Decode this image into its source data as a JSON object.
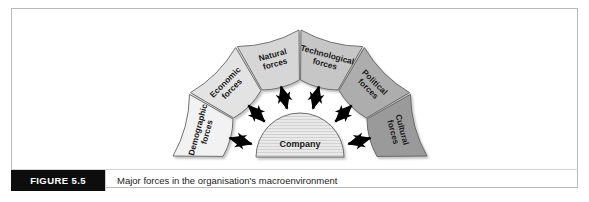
{
  "figure": {
    "tag_label": "FIGURE 5.5",
    "caption": "Major forces in the organisation's macroenvironment"
  },
  "diagram": {
    "center": {
      "label": "Company",
      "fill": "#e8e8e8",
      "stroke": "#6e6e6e"
    },
    "segments": [
      {
        "label_line1": "Demographic",
        "label_line2": "forces",
        "fill": "#f2f2f2",
        "stroke": "#707070",
        "mid_angle_deg": 165
      },
      {
        "label_line1": "Economic",
        "label_line2": "forces",
        "fill": "#e3e3e3",
        "stroke": "#707070",
        "mid_angle_deg": 135
      },
      {
        "label_line1": "Natural",
        "label_line2": "forces",
        "fill": "#d6d6d6",
        "stroke": "#707070",
        "mid_angle_deg": 105
      },
      {
        "label_line1": "Technological",
        "label_line2": "forces",
        "fill": "#c6c6c6",
        "stroke": "#707070",
        "mid_angle_deg": 75
      },
      {
        "label_line1": "Political",
        "label_line2": "forces",
        "fill": "#adadad",
        "stroke": "#6a6a6a",
        "mid_angle_deg": 45
      },
      {
        "label_line1": "Cultural",
        "label_line2": "forces",
        "fill": "#9a9a9a",
        "stroke": "#6a6a6a",
        "mid_angle_deg": 15
      }
    ],
    "arrow_color": "#000000",
    "arrow_count": 6,
    "arrow_style": "double-headed"
  },
  "colors": {
    "frame_border": "#b9b9b9",
    "caption_tag_bg": "#0d0d0d",
    "caption_tag_text": "#ffffff",
    "caption_text": "#1c1c1c",
    "page_background": "#ffffff"
  }
}
